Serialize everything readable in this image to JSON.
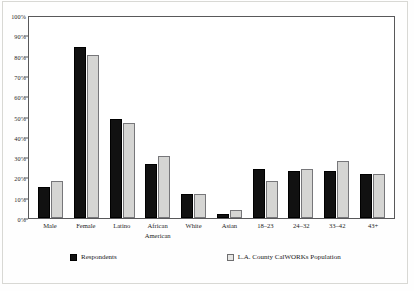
{
  "chart_data": {
    "type": "bar",
    "title": "",
    "subtitle": "",
    "xlabel": "",
    "ylabel": "",
    "ylim": [
      0,
      100
    ],
    "y_ticks": [
      "0%",
      "10%",
      "20%",
      "30%",
      "40%",
      "50%",
      "60%",
      "70%",
      "80%",
      "90%",
      "100%"
    ],
    "y_tick_values": [
      0,
      10,
      20,
      30,
      40,
      50,
      60,
      70,
      80,
      90,
      100
    ],
    "grid": false,
    "legend_position": "bottom",
    "categories": [
      "Male",
      "Female",
      "Latino",
      "African\nAmerican",
      "White",
      "Asian",
      "18–23",
      "24–32",
      "33–42",
      "43+"
    ],
    "series": [
      {
        "name": "Respondents",
        "color": "#111111",
        "values": [
          15.5,
          84,
          49,
          26.5,
          12,
          2,
          24,
          23,
          23,
          21.5
        ]
      },
      {
        "name": "L.A. County CalWORKs Population",
        "color": "#d5d5d3",
        "values": [
          18,
          80.5,
          47,
          30.5,
          12,
          4,
          18,
          24,
          28,
          21.5
        ]
      }
    ]
  },
  "legend": {
    "items": [
      {
        "label": "Respondents",
        "swatch": "series-a"
      },
      {
        "label": "L.A. County CalWORKs Population",
        "swatch": "series-b"
      }
    ]
  },
  "colors": {
    "series_a": "#111111",
    "series_b": "#d5d5d3",
    "axis": "#58585a",
    "background": "#ffffff"
  }
}
